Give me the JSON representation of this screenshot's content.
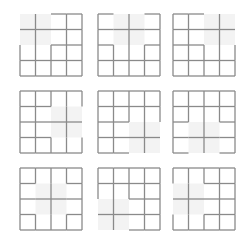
{
  "diagram": {
    "grid_size": 4,
    "block_size": 2,
    "colors": {
      "line": "#8a8a8a",
      "shade": "#f3f3f3",
      "background": "#ffffff"
    },
    "panels": [
      {
        "id": 1,
        "row": 0,
        "col": 0,
        "shaded_block": {
          "col": 0,
          "row": 0
        }
      },
      {
        "id": 2,
        "row": 0,
        "col": 1,
        "shaded_block": {
          "col": 1,
          "row": 0
        }
      },
      {
        "id": 3,
        "row": 0,
        "col": 2,
        "shaded_block": {
          "col": 2,
          "row": 0
        }
      },
      {
        "id": 4,
        "row": 1,
        "col": 0,
        "shaded_block": {
          "col": 2,
          "row": 1
        }
      },
      {
        "id": 5,
        "row": 1,
        "col": 1,
        "shaded_block": {
          "col": 2,
          "row": 2
        }
      },
      {
        "id": 6,
        "row": 1,
        "col": 2,
        "shaded_block": {
          "col": 1,
          "row": 2
        }
      },
      {
        "id": 7,
        "row": 2,
        "col": 0,
        "shaded_block": {
          "col": 1,
          "row": 1
        }
      },
      {
        "id": 8,
        "row": 2,
        "col": 1,
        "shaded_block": {
          "col": 0,
          "row": 2
        }
      },
      {
        "id": 9,
        "row": 2,
        "col": 2,
        "shaded_block": {
          "col": 0,
          "row": 1
        }
      }
    ]
  }
}
